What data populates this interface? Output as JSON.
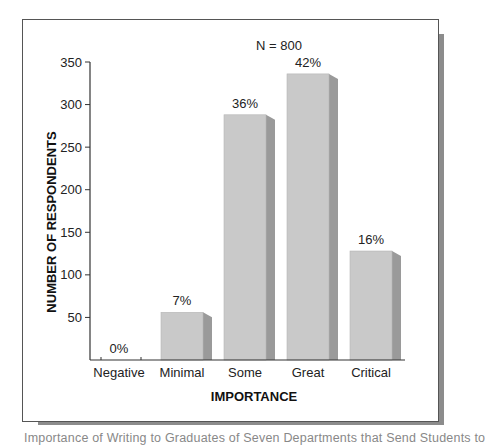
{
  "chart_data": {
    "type": "bar",
    "title": "",
    "annotation": "N = 800",
    "xlabel": "IMPORTANCE",
    "ylabel": "NUMBER OF RESPONDENTS",
    "categories": [
      "Negative",
      "Minimal",
      "Some",
      "Great",
      "Critical"
    ],
    "values": [
      0,
      56,
      288,
      336,
      128
    ],
    "data_labels": [
      "0%",
      "7%",
      "36%",
      "42%",
      "16%"
    ],
    "ylim": [
      0,
      350
    ],
    "yticks": [
      50,
      100,
      150,
      200,
      250,
      300,
      350
    ],
    "grid": false,
    "legend": "none",
    "colors": {
      "bar_face": "#c9c9c9",
      "bar_side": "#9a9a9a",
      "frame": "#555555",
      "frame_shadow": "#8c8c8c",
      "axis": "#333333"
    }
  },
  "caption": "Importance of Writing to Graduates of Seven Departments that Send Students to"
}
